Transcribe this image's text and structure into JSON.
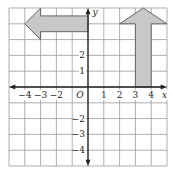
{
  "diagram": {
    "type": "coordinate-grid",
    "x_range": [
      -5,
      5
    ],
    "y_range": [
      -5,
      5
    ],
    "axis_labels": {
      "x": "x",
      "y": "y",
      "origin": "O"
    },
    "x_ticks": [
      {
        "value": -4,
        "label": "−4"
      },
      {
        "value": -3,
        "label": "−3"
      },
      {
        "value": -2,
        "label": "−2"
      },
      {
        "value": 1,
        "label": "1"
      },
      {
        "value": 2,
        "label": "2"
      },
      {
        "value": 3,
        "label": "3"
      },
      {
        "value": 4,
        "label": "4"
      }
    ],
    "y_ticks": [
      {
        "value": 2,
        "label": "2"
      },
      {
        "value": 1,
        "label": "1"
      },
      {
        "value": -2,
        "label": "−2"
      },
      {
        "value": -3,
        "label": "−3"
      },
      {
        "value": -4,
        "label": "−4"
      }
    ],
    "shapes": [
      {
        "name": "left-arrow",
        "fill": "#c8c8c8",
        "stroke": "#666666",
        "points": [
          [
            -3,
            5
          ],
          [
            -4,
            4
          ],
          [
            -3,
            3
          ],
          [
            -3,
            3.5
          ],
          [
            0,
            3.5
          ],
          [
            0,
            4.5
          ],
          [
            -3,
            4.5
          ]
        ]
      },
      {
        "name": "up-arrow",
        "fill": "#c8c8c8",
        "stroke": "#666666",
        "points": [
          [
            3.5,
            5
          ],
          [
            2,
            4
          ],
          [
            3,
            4
          ],
          [
            3,
            0
          ],
          [
            4,
            0
          ],
          [
            4,
            4
          ],
          [
            5,
            4
          ]
        ]
      }
    ],
    "colors": {
      "grid": "#9a9a9a",
      "axis": "#222222",
      "shape_fill": "#c8c8c8"
    }
  }
}
